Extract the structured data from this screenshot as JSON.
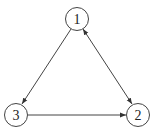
{
  "diagram": {
    "type": "directed-graph",
    "nodes": [
      {
        "id": "1",
        "label": "1",
        "x": 77,
        "y": 19
      },
      {
        "id": "2",
        "label": "2",
        "x": 138,
        "y": 115
      },
      {
        "id": "3",
        "label": "3",
        "x": 16,
        "y": 115
      }
    ],
    "edges": [
      {
        "from": "1",
        "to": "3",
        "direction": "forward"
      },
      {
        "from": "1",
        "to": "2",
        "direction": "both"
      },
      {
        "from": "3",
        "to": "2",
        "direction": "forward"
      }
    ]
  }
}
